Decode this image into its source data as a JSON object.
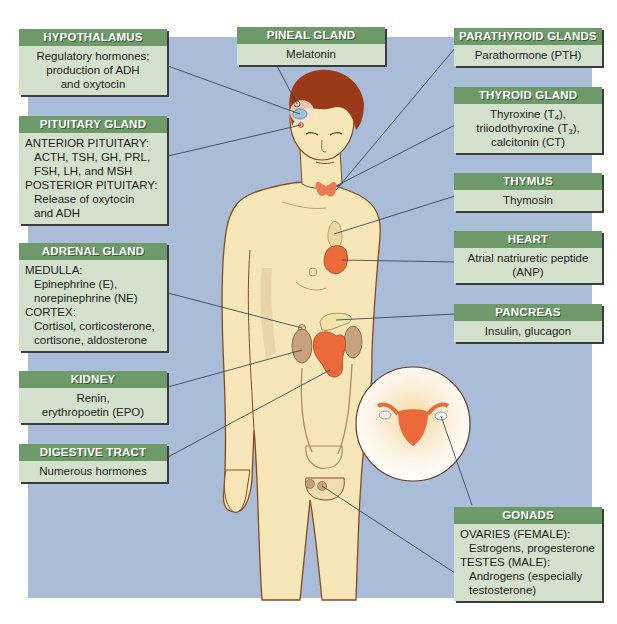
{
  "colors": {
    "background_panel": "#a9bcd8",
    "label_header": "#6e9a69",
    "label_body": "#d4e1cc",
    "skin": "#f6e6b8",
    "hair": "#9a3a18",
    "gland_orange": "#ec6a3a"
  },
  "labels": {
    "hypothalamus": {
      "title": "HYPOTHALAMUS",
      "lines": [
        "Regulatory hormones;",
        "production of ADH",
        "and oxytocin"
      ]
    },
    "pituitary": {
      "title": "PITUITARY GLAND",
      "lines": [
        "ANTERIOR PITUITARY:",
        "ACTH, TSH, GH, PRL,",
        "FSH, LH, and MSH",
        "POSTERIOR PITUITARY:",
        "Release of oxytocin",
        "and ADH"
      ]
    },
    "adrenal": {
      "title": "ADRENAL GLAND",
      "lines": [
        "MEDULLA:",
        "Epinephrine (E),",
        "norepinephrine (NE)",
        "CORTEX:",
        "Cortisol, corticosterone,",
        "cortisone, aldosterone"
      ]
    },
    "kidney": {
      "title": "KIDNEY",
      "lines": [
        "Renin,",
        "erythropoetin (EPO)"
      ]
    },
    "digestive": {
      "title": "DIGESTIVE TRACT",
      "lines": [
        "Numerous hormones"
      ]
    },
    "pineal": {
      "title": "PINEAL GLAND",
      "lines": [
        "Melatonin"
      ]
    },
    "parathyroid": {
      "title": "PARATHYROID GLANDS",
      "lines": [
        "Parathormone (PTH)"
      ]
    },
    "thyroid": {
      "title": "THYROID GLAND",
      "line1_pre": "Thyroxine (T",
      "line1_sub": "4",
      "line1_post": "),",
      "line2_pre": "triiodothyroxine (T",
      "line2_sub": "3",
      "line2_post": "),",
      "line3": "calcitonin (CT)"
    },
    "thymus": {
      "title": "THYMUS",
      "lines": [
        "Thymosin"
      ]
    },
    "heart": {
      "title": "HEART",
      "lines": [
        "Atrial natriuretic peptide",
        "(ANP)"
      ]
    },
    "pancreas": {
      "title": "PANCREAS",
      "lines": [
        "Insulin, glucagon"
      ]
    },
    "gonads": {
      "title": "GONADS",
      "lines": [
        "OVARIES (FEMALE):",
        "Estrogens, progesterone",
        "TESTES (MALE):",
        "Androgens (especially",
        "testosterone)"
      ]
    }
  }
}
